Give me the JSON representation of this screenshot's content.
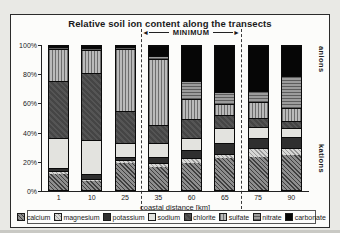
{
  "title": "Relative soil ion content along the transects",
  "annotations": {
    "minimum_label": "MINIMUM",
    "left_arrow": "◄",
    "right_arrow": "►",
    "right_top_label": "anions",
    "right_bottom_label": "kations"
  },
  "axes": {
    "x_label": "coastal distance [km]",
    "y_ticks": [
      "100%",
      "80%",
      "60%",
      "40%",
      "20%",
      "0%"
    ]
  },
  "chart_data": {
    "type": "bar",
    "stacked": true,
    "title": "Relative soil ion content along the transects",
    "xlabel": "coastal distance [km]",
    "ylabel": "",
    "ylim": [
      0,
      100
    ],
    "y_tick_labels": [
      "0%",
      "20%",
      "40%",
      "60%",
      "80%",
      "100%"
    ],
    "grid": false,
    "legend_position": "bottom",
    "categories": [
      "1",
      "10",
      "25",
      "35",
      "60",
      "65",
      "75",
      "90"
    ],
    "annotation_minimum_span_categories": [
      "35",
      "60",
      "65"
    ],
    "series": [
      {
        "name": "calcium",
        "pattern": "dark-diagonal-hatch",
        "color": "#6a6a6a",
        "values": [
          11,
          6,
          19,
          16,
          19,
          22,
          23,
          24
        ]
      },
      {
        "name": "magnesium",
        "pattern": "light-diagonal-hatch",
        "color": "#c0c0c0",
        "values": [
          2,
          2,
          2,
          3,
          3,
          3,
          6,
          5
        ]
      },
      {
        "name": "potassium",
        "pattern": "solid-dark",
        "color": "#2f2f2f",
        "values": [
          2,
          3,
          2,
          4,
          6,
          8,
          7,
          8
        ]
      },
      {
        "name": "sodium",
        "pattern": "solid-light",
        "color": "#e3e3df",
        "values": [
          21,
          24,
          10,
          10,
          8,
          10,
          8,
          6
        ]
      },
      {
        "name": "chlorite",
        "pattern": "dense-dark-hatch",
        "color": "#4d4d4d",
        "values": [
          40,
          46,
          22,
          12,
          13,
          9,
          6,
          5
        ]
      },
      {
        "name": "sulfate",
        "pattern": "vertical-lines",
        "color": "#969696",
        "values": [
          22,
          16,
          43,
          46,
          14,
          8,
          11,
          9
        ]
      },
      {
        "name": "nitrate",
        "pattern": "horizontal-lines",
        "color": "#7d7d7d",
        "values": [
          1,
          2,
          1,
          2,
          13,
          8,
          8,
          22
        ]
      },
      {
        "name": "carbonate",
        "pattern": "solid-black",
        "color": "#060606",
        "values": [
          1,
          1,
          1,
          7,
          24,
          32,
          31,
          21
        ]
      }
    ]
  },
  "legend": {
    "items": [
      "calcium",
      "magnesium",
      "potassium",
      "sodium",
      "chlorite",
      "sulfate",
      "nitrate",
      "carbonate"
    ]
  }
}
